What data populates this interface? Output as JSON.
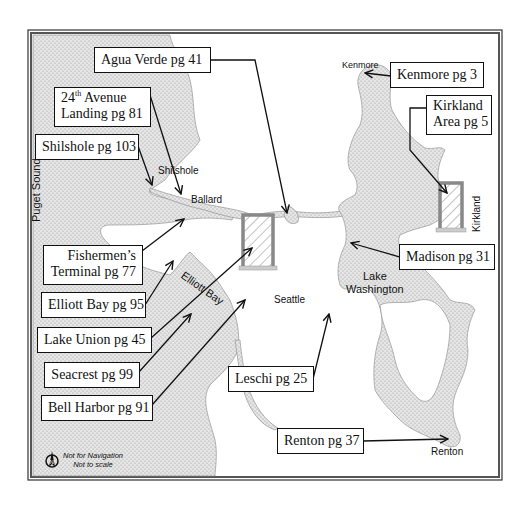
{
  "map": {
    "title": "Seattle area marina map",
    "water_labels": {
      "puget_sound": "Puget Sound",
      "elliott_bay": "Elliott Bay",
      "lake_washington_line1": "Lake",
      "lake_washington_line2": "Washington"
    },
    "place_labels": {
      "shilshole": "Shilshole",
      "ballard": "Ballard",
      "seattle": "Seattle",
      "kenmore": "Kenmore",
      "kirkland": "Kirkland",
      "renton": "Renton"
    },
    "callouts": [
      {
        "id": "agua-verde",
        "line1": "Agua Verde pg 41"
      },
      {
        "id": "24th-avenue",
        "line1_num": "24",
        "line1_sup": "th",
        "line1_rest": " Avenue",
        "line2": "Landing pg 81"
      },
      {
        "id": "shilshole",
        "line1": "Shilshole pg 103"
      },
      {
        "id": "fishermens-terminal",
        "line1": "Fishermen’s",
        "line2": "Terminal pg 77"
      },
      {
        "id": "elliott-bay",
        "line1": "Elliott Bay pg 95"
      },
      {
        "id": "lake-union",
        "line1": "Lake Union pg 45"
      },
      {
        "id": "seacrest",
        "line1": "Seacrest pg 99"
      },
      {
        "id": "bell-harbor",
        "line1": "Bell Harbor pg 91"
      },
      {
        "id": "kenmore",
        "line1": "Kenmore pg 3"
      },
      {
        "id": "kirkland",
        "line1": "Kirkland",
        "line2": "Area pg 5"
      },
      {
        "id": "madison",
        "line1": "Madison pg 31"
      },
      {
        "id": "leschi",
        "line1": "Leschi pg 25"
      },
      {
        "id": "renton",
        "line1": "Renton pg 37"
      }
    ],
    "notes": {
      "line1": "Not for Navigation",
      "line2": "Not to scale"
    },
    "colors": {
      "water": "#e2e2e2",
      "border": "#333333",
      "box_fill": "#ffffff",
      "hatch_frame": "#8a8a8a"
    }
  }
}
